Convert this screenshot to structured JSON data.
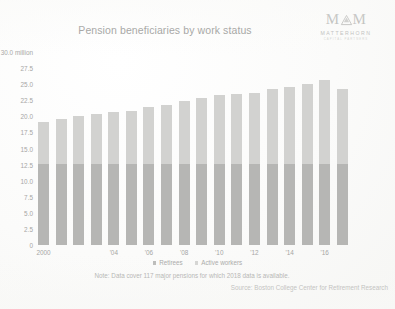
{
  "header": {
    "title": "Pension beneficiaries by work status",
    "logo_mark": "MM",
    "logo_wordmark": "MATTERHORN",
    "logo_tagline": "CAPITAL PARTNERS"
  },
  "legend": {
    "items": [
      {
        "label": "Retirees",
        "color": "#b6b6b4"
      },
      {
        "label": "Active workers",
        "color": "#d2d2d0"
      }
    ]
  },
  "footnotes": {
    "note": "Note: Data cover 117 major pensions for which 2018 data is available.",
    "source": "Source: Boston College Center for Retirement Research"
  },
  "chart_data": {
    "type": "bar",
    "stacked": true,
    "title": "Pension beneficiaries by work status",
    "xlabel": "",
    "ylabel": "",
    "ylim": [
      0,
      30
    ],
    "yunit": "million",
    "grid": false,
    "legend_position": "bottom",
    "ytick_labels": [
      "30.0 million",
      "27.5",
      "25.0",
      "22.5",
      "20.0",
      "17.5",
      "15.0",
      "12.5",
      "10.0",
      "7.5",
      "5.0",
      "2.5",
      "0"
    ],
    "ytick_values": [
      30.0,
      27.5,
      25.0,
      22.5,
      20.0,
      17.5,
      15.0,
      12.5,
      10.0,
      7.5,
      5.0,
      2.5,
      0
    ],
    "categories": [
      2000,
      2001,
      2002,
      2003,
      2004,
      2005,
      2006,
      2007,
      2008,
      2009,
      2010,
      2011,
      2012,
      2013,
      2014,
      2015,
      2016,
      2017
    ],
    "xtick_labels": [
      "2000",
      "",
      "",
      "",
      "'04",
      "",
      "'06",
      "",
      "'08",
      "",
      "'10",
      "",
      "'12",
      "",
      "'14",
      "",
      "'16",
      ""
    ],
    "series": [
      {
        "name": "Retirees",
        "color": "#b6b6b4",
        "values": [
          12.6,
          12.6,
          12.6,
          12.6,
          12.6,
          12.6,
          12.6,
          12.6,
          12.6,
          12.6,
          12.6,
          12.6,
          12.6,
          12.6,
          12.6,
          12.6,
          12.6,
          12.6
        ]
      },
      {
        "name": "Active workers",
        "color": "#d2d2d0",
        "values": [
          6.5,
          7.0,
          7.5,
          7.7,
          8.1,
          8.3,
          8.8,
          9.2,
          9.8,
          10.3,
          10.7,
          10.8,
          11.1,
          11.6,
          11.9,
          12.4,
          13.0,
          11.6
        ]
      }
    ],
    "totals": [
      19.1,
      19.6,
      20.1,
      20.3,
      20.7,
      20.9,
      21.4,
      21.8,
      22.4,
      22.9,
      23.3,
      23.4,
      23.7,
      24.2,
      24.5,
      25.0,
      25.6,
      24.2
    ]
  }
}
